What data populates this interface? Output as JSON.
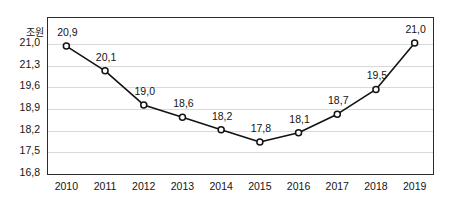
{
  "chart_data": {
    "type": "line",
    "title": "",
    "subtitle": "",
    "unit_label": "조원",
    "xlabel": "",
    "ylabel": "",
    "categories": [
      "2010",
      "2011",
      "2012",
      "2013",
      "2014",
      "2015",
      "2016",
      "2017",
      "2018",
      "2019"
    ],
    "values": [
      20.9,
      20.1,
      19.0,
      18.6,
      18.2,
      17.8,
      18.1,
      18.7,
      19.5,
      21.0
    ],
    "point_labels": [
      "20,9",
      "20,1",
      "19,0",
      "18,6",
      "18,2",
      "17,8",
      "18,1",
      "18,7",
      "19,5",
      "21,0"
    ],
    "ytick_labels": [
      "16,8",
      "17,5",
      "18,2",
      "18,9",
      "19,6",
      "21,3",
      "21,0"
    ],
    "ytick_values": [
      16.8,
      17.5,
      18.2,
      18.9,
      19.6,
      20.3,
      21.0
    ],
    "ylim": [
      16.8,
      21.35
    ],
    "grid": true,
    "legend": "none",
    "series_color": "#121212",
    "grid_color": "#d9d9d9",
    "frame_color": "#2b2b2b",
    "marker": "open-circle"
  }
}
